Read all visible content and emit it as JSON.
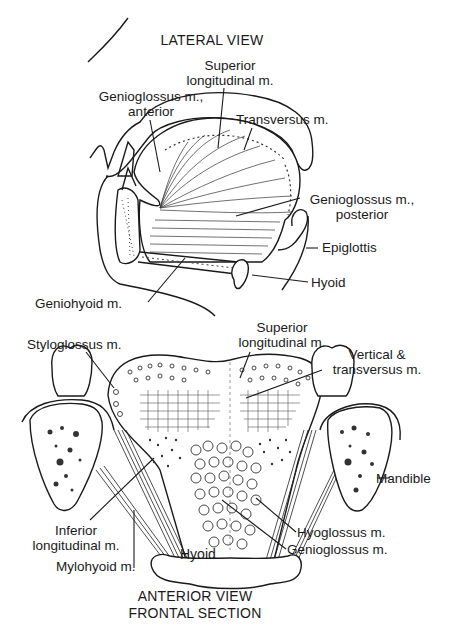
{
  "lateral_view": {
    "title": "LATERAL VIEW",
    "labels": {
      "superior_longitudinal": [
        "Superior",
        "longitudinal m."
      ],
      "genioglossus_anterior": [
        "Genioglossus m.,",
        "anterior"
      ],
      "transversus": "Transversus m.",
      "genioglossus_posterior": [
        "Genioglossus m.,",
        "posterior"
      ],
      "epiglottis": "Epiglottis",
      "hyoid": "Hyoid",
      "geniohyoid": "Geniohyoid m."
    }
  },
  "anterior_view": {
    "title": [
      "ANTERIOR VIEW",
      "FRONTAL SECTION"
    ],
    "labels": {
      "styloglossus": "Styloglossus m.",
      "superior_longitudinal": [
        "Superior",
        "longitudinal m."
      ],
      "vertical_transversus": [
        "Vertical &",
        "transversus m."
      ],
      "mandible": "Mandible",
      "inferior_longitudinal": [
        "Inferior",
        "longitudinal m."
      ],
      "mylohyoid": "Mylohyoid m.",
      "hyoid": "Hyoid",
      "hyoglossus": "Hyoglossus m.",
      "genioglossus": "Genioglossus m."
    }
  }
}
